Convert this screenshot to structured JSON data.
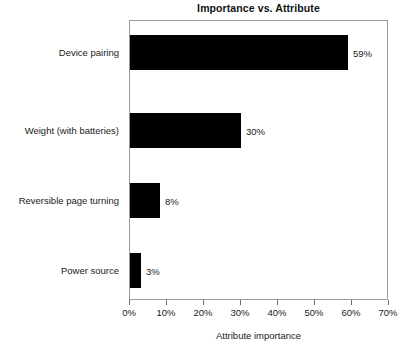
{
  "chart_data": {
    "type": "bar",
    "orientation": "horizontal",
    "title": "Importance vs. Attribute",
    "xlabel": "Attribute importance",
    "ylabel": "",
    "categories": [
      "Device pairing",
      "Weight (with batteries)",
      "Reversible page turning",
      "Power source"
    ],
    "values": [
      59,
      30,
      8,
      3
    ],
    "value_labels": [
      "59%",
      "30%",
      "8%",
      "3%"
    ],
    "xlim": [
      0,
      70
    ],
    "xticks": [
      0,
      10,
      20,
      30,
      40,
      50,
      60,
      70
    ],
    "xtick_labels": [
      "0%",
      "10%",
      "20%",
      "30%",
      "40%",
      "50%",
      "60%",
      "70%"
    ],
    "grid": false,
    "legend": null,
    "bar_color": "#000000",
    "frame_color": "#9a9a9a",
    "background_color": "#ffffff",
    "text_color": "#1a1a1a"
  }
}
